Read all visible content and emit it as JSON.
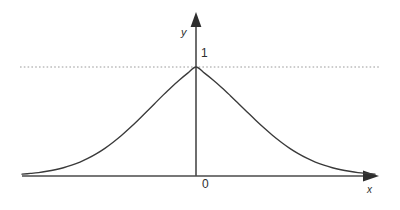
{
  "figure": {
    "background_color": "#ffffff",
    "line_color": "#3a3a3a",
    "axis_color": "#4a4a4a",
    "guide_color": "#9a9a9a",
    "text_color": "#2e2e2e",
    "y_axis_label": "y",
    "x_axis_label": "x",
    "origin_label": "0",
    "peak_value_label": "1"
  },
  "chart_data": {
    "type": "line",
    "title": "",
    "xlabel": "x",
    "ylabel": "y",
    "xlim": [
      -4.2,
      4.2
    ],
    "ylim": [
      0,
      1.18
    ],
    "grid": false,
    "legend": null,
    "axis_style": {
      "x_axis_arrow": true,
      "y_axis_arrow": true,
      "x_axis_at_y": 0,
      "y_axis_at_x": 0
    },
    "tick_labels": {
      "x": [
        "0"
      ],
      "y": [
        "1"
      ]
    },
    "annotations": [
      {
        "type": "hline",
        "y": 1,
        "style": "dotted",
        "label": "1",
        "x_start": -4.2,
        "x_end": 4.2
      }
    ],
    "series": [
      {
        "name": "bell curve",
        "function": "y = exp(-x^2)",
        "peak_x": 0,
        "peak_y": 1,
        "x": [
          -4.2,
          -4.0,
          -3.8,
          -3.6,
          -3.4,
          -3.2,
          -3.0,
          -2.8,
          -2.6,
          -2.4,
          -2.2,
          -2.0,
          -1.8,
          -1.6,
          -1.4,
          -1.2,
          -1.0,
          -0.8,
          -0.6,
          -0.4,
          -0.2,
          0.0,
          0.2,
          0.4,
          0.6,
          0.8,
          1.0,
          1.2,
          1.4,
          1.6,
          1.8,
          2.0,
          2.2,
          2.4,
          2.6,
          2.8,
          3.0,
          3.2,
          3.4,
          3.6,
          3.8,
          4.0,
          4.2
        ],
        "values": [
          0.013,
          0.018,
          0.024,
          0.033,
          0.044,
          0.058,
          0.076,
          0.098,
          0.125,
          0.157,
          0.194,
          0.237,
          0.284,
          0.336,
          0.391,
          0.449,
          0.507,
          0.565,
          0.621,
          0.673,
          0.721,
          0.764,
          0.721,
          0.673,
          0.621,
          0.565,
          0.507,
          0.449,
          0.391,
          0.336,
          0.284,
          0.237,
          0.194,
          0.157,
          0.125,
          0.098,
          0.076,
          0.058,
          0.044,
          0.033,
          0.024,
          0.018,
          0.013
        ]
      }
    ]
  }
}
